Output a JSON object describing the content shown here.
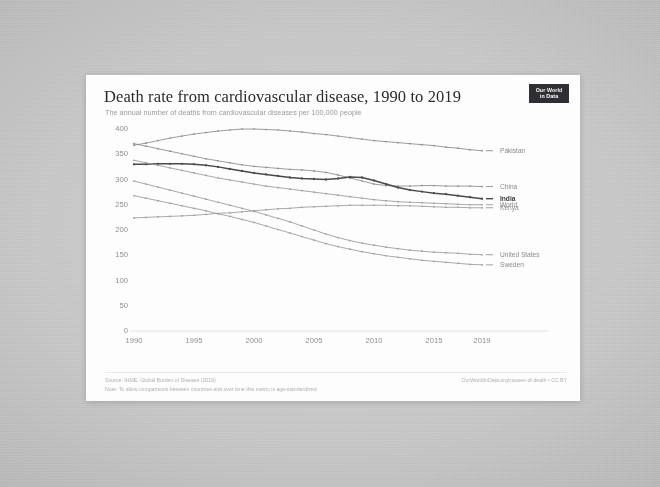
{
  "card": {
    "title": "Death rate from cardiovascular disease, 1990 to 2019",
    "subtitle": "The annual number of deaths from cardiovascular diseases per 100,000 people",
    "logo_line1": "Our World",
    "logo_line2": "in Data"
  },
  "footer": {
    "source": "Source: IHME, Global Burden of Disease (2019)",
    "note": "Note: To allow comparisons between countries and over time this metric is age-standardized",
    "credit": "OurWorldInData.org/causes-of-death • CC BY"
  },
  "chart_data": {
    "type": "line",
    "title": "Death rate from cardiovascular disease, 1990 to 2019",
    "subtitle": "The annual number of deaths from cardiovascular diseases per 100,000 people",
    "xlabel": "",
    "ylabel": "",
    "xlim": [
      1990,
      2019
    ],
    "ylim": [
      0,
      400
    ],
    "yticks": [
      0,
      50,
      100,
      150,
      200,
      250,
      300,
      350,
      400
    ],
    "xticks": [
      1990,
      1995,
      2000,
      2005,
      2010,
      2015,
      2019
    ],
    "grid": false,
    "legend_position": "right-inline",
    "x": [
      1990,
      1991,
      1992,
      1993,
      1994,
      1995,
      1996,
      1997,
      1998,
      1999,
      2000,
      2001,
      2002,
      2003,
      2004,
      2005,
      2006,
      2007,
      2008,
      2009,
      2010,
      2011,
      2012,
      2013,
      2014,
      2015,
      2016,
      2017,
      2018,
      2019
    ],
    "series": [
      {
        "name": "Pakistan",
        "color": "#8a8a8a",
        "emphasis": false,
        "label_value": 357,
        "values": [
          368,
          372,
          377,
          382,
          386,
          390,
          393,
          396,
          398,
          400,
          400,
          399,
          398,
          396,
          394,
          391,
          389,
          386,
          383,
          380,
          377,
          375,
          373,
          371,
          369,
          367,
          364,
          362,
          359,
          357
        ]
      },
      {
        "name": "China",
        "color": "#8a8a8a",
        "emphasis": false,
        "label_value": 286,
        "values": [
          371,
          366,
          361,
          356,
          351,
          346,
          341,
          337,
          333,
          329,
          326,
          324,
          322,
          320,
          319,
          317,
          314,
          309,
          303,
          297,
          291,
          288,
          287,
          287,
          288,
          288,
          287,
          287,
          287,
          286
        ]
      },
      {
        "name": "India",
        "color": "#4a4a4a",
        "emphasis": true,
        "label_value": 262,
        "values": [
          330,
          330,
          331,
          331,
          331,
          330,
          328,
          325,
          321,
          317,
          313,
          310,
          307,
          304,
          302,
          301,
          300,
          302,
          305,
          304,
          298,
          291,
          284,
          279,
          276,
          273,
          271,
          268,
          265,
          262
        ]
      },
      {
        "name": "World",
        "color": "#9a9a9a",
        "emphasis": false,
        "label_value": 250,
        "values": [
          338,
          333,
          328,
          323,
          318,
          313,
          308,
          303,
          299,
          295,
          291,
          287,
          284,
          281,
          278,
          275,
          272,
          269,
          266,
          263,
          260,
          258,
          256,
          255,
          254,
          253,
          252,
          251,
          250,
          250
        ]
      },
      {
        "name": "Kenya",
        "color": "#9a9a9a",
        "emphasis": false,
        "label_value": 244,
        "values": [
          224,
          225,
          226,
          227,
          228,
          229,
          231,
          233,
          234,
          236,
          238,
          240,
          242,
          243,
          245,
          246,
          247,
          248,
          249,
          249,
          249,
          249,
          248,
          248,
          247,
          246,
          245,
          245,
          244,
          244
        ]
      },
      {
        "name": "United States",
        "color": "#9a9a9a",
        "emphasis": false,
        "label_value": 151,
        "values": [
          297,
          291,
          285,
          279,
          273,
          267,
          261,
          255,
          249,
          243,
          237,
          230,
          223,
          216,
          208,
          200,
          192,
          185,
          179,
          174,
          170,
          166,
          163,
          160,
          158,
          156,
          155,
          154,
          152,
          151
        ]
      },
      {
        "name": "Sweden",
        "color": "#9a9a9a",
        "emphasis": false,
        "label_value": 131,
        "values": [
          268,
          263,
          258,
          253,
          248,
          243,
          238,
          232,
          227,
          221,
          215,
          208,
          201,
          194,
          187,
          180,
          173,
          167,
          162,
          157,
          153,
          149,
          146,
          143,
          140,
          138,
          136,
          134,
          132,
          131
        ]
      }
    ]
  }
}
